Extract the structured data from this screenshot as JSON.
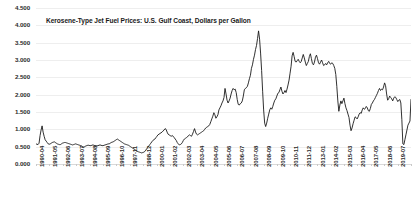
{
  "chart_data": {
    "type": "line",
    "title": "Kerosene-Type Jet Fuel Prices: U.S. Gulf Coast, Dollars per Gallon",
    "xlabel": "",
    "ylabel": "",
    "ylim": [
      0.0,
      4.5
    ],
    "grid": true,
    "legend": false,
    "line_color": "#1a1a1a",
    "ytick_labels": [
      "4.500",
      "4.000",
      "3.500",
      "3.000",
      "2.500",
      "2.000",
      "1.500",
      "1.000",
      "0.500",
      "0.000"
    ],
    "ytick_values": [
      4.5,
      4.0,
      3.5,
      3.0,
      2.5,
      2.0,
      1.5,
      1.0,
      0.5,
      0.0
    ],
    "xtick_labels": [
      "1990-04",
      "1991-05",
      "1992-06",
      "1993-07",
      "1994-08",
      "1995-09",
      "1996-10",
      "1997-11",
      "1998-12",
      "2000-01",
      "2001-02",
      "2002-03",
      "2003-04",
      "2004-05",
      "2005-06",
      "2006-07",
      "2007-08",
      "2008-09",
      "2009-10",
      "2010-11",
      "2011-12",
      "2013-01",
      "2014-02",
      "2015-03",
      "2016-04",
      "2017-05",
      "2018-06",
      "2019-07",
      "2020-08"
    ],
    "x_start": "1990-04",
    "x_end": "2020-08",
    "x_interval_months": 1,
    "values": [
      0.58,
      0.57,
      0.56,
      0.6,
      0.82,
      0.98,
      1.1,
      0.92,
      0.8,
      0.7,
      0.66,
      0.62,
      0.58,
      0.57,
      0.58,
      0.6,
      0.62,
      0.63,
      0.64,
      0.62,
      0.6,
      0.58,
      0.57,
      0.56,
      0.56,
      0.58,
      0.6,
      0.61,
      0.62,
      0.62,
      0.61,
      0.6,
      0.59,
      0.58,
      0.57,
      0.56,
      0.55,
      0.56,
      0.57,
      0.58,
      0.57,
      0.56,
      0.55,
      0.54,
      0.53,
      0.52,
      0.5,
      0.49,
      0.5,
      0.52,
      0.53,
      0.54,
      0.54,
      0.53,
      0.53,
      0.54,
      0.55,
      0.54,
      0.53,
      0.53,
      0.52,
      0.53,
      0.54,
      0.55,
      0.54,
      0.53,
      0.53,
      0.54,
      0.55,
      0.56,
      0.57,
      0.58,
      0.58,
      0.6,
      0.62,
      0.63,
      0.64,
      0.66,
      0.68,
      0.7,
      0.72,
      0.7,
      0.68,
      0.66,
      0.64,
      0.62,
      0.6,
      0.58,
      0.57,
      0.56,
      0.55,
      0.54,
      0.52,
      0.5,
      0.48,
      0.46,
      0.44,
      0.42,
      0.4,
      0.38,
      0.36,
      0.35,
      0.34,
      0.33,
      0.32,
      0.33,
      0.34,
      0.36,
      0.4,
      0.44,
      0.48,
      0.52,
      0.56,
      0.6,
      0.64,
      0.68,
      0.7,
      0.72,
      0.76,
      0.8,
      0.84,
      0.86,
      0.88,
      0.9,
      0.92,
      0.95,
      0.98,
      1.02,
      1.0,
      0.92,
      0.86,
      0.84,
      0.82,
      0.8,
      0.82,
      0.8,
      0.76,
      0.72,
      0.68,
      0.62,
      0.58,
      0.55,
      0.56,
      0.58,
      0.62,
      0.68,
      0.72,
      0.74,
      0.76,
      0.78,
      0.82,
      0.84,
      0.82,
      0.8,
      0.86,
      0.94,
      1.02,
      0.92,
      0.86,
      0.84,
      0.86,
      0.88,
      0.9,
      0.92,
      0.94,
      0.96,
      1.0,
      1.04,
      1.06,
      1.08,
      1.1,
      1.14,
      1.22,
      1.3,
      1.38,
      1.48,
      1.42,
      1.32,
      1.36,
      1.42,
      1.56,
      1.62,
      1.68,
      1.76,
      1.82,
      1.92,
      2.18,
      2.02,
      1.84,
      1.76,
      1.82,
      1.9,
      2.02,
      2.12,
      2.18,
      2.14,
      2.16,
      2.06,
      1.86,
      1.72,
      1.7,
      1.74,
      1.76,
      1.82,
      1.96,
      2.14,
      2.18,
      2.2,
      2.24,
      2.34,
      2.46,
      2.56,
      2.76,
      2.86,
      3.02,
      3.14,
      3.3,
      3.42,
      3.62,
      3.84,
      3.6,
      3.2,
      2.7,
      2.1,
      1.56,
      1.18,
      1.08,
      1.18,
      1.32,
      1.44,
      1.56,
      1.62,
      1.58,
      1.66,
      1.76,
      1.84,
      1.88,
      1.96,
      2.04,
      2.06,
      2.14,
      2.22,
      2.1,
      2.02,
      2.06,
      2.12,
      2.06,
      2.16,
      2.28,
      2.42,
      2.62,
      2.82,
      3.12,
      3.22,
      3.1,
      2.96,
      2.94,
      2.98,
      3.02,
      2.96,
      2.92,
      2.96,
      3.06,
      3.16,
      3.06,
      2.94,
      2.84,
      2.9,
      2.96,
      3.1,
      3.18,
      3.04,
      2.9,
      2.86,
      2.94,
      3.08,
      3.14,
      3.04,
      2.92,
      2.88,
      2.94,
      3.0,
      2.92,
      2.84,
      2.86,
      2.9,
      2.86,
      2.92,
      2.96,
      2.9,
      2.88,
      2.92,
      2.9,
      2.84,
      2.76,
      2.58,
      2.24,
      1.82,
      1.52,
      1.7,
      1.82,
      1.74,
      1.82,
      1.9,
      1.74,
      1.62,
      1.54,
      1.44,
      1.34,
      1.12,
      0.96,
      1.04,
      1.16,
      1.26,
      1.36,
      1.34,
      1.3,
      1.36,
      1.44,
      1.48,
      1.46,
      1.56,
      1.62,
      1.58,
      1.6,
      1.66,
      1.62,
      1.54,
      1.52,
      1.6,
      1.72,
      1.76,
      1.82,
      1.86,
      1.92,
      1.98,
      2.04,
      2.12,
      2.18,
      2.12,
      2.16,
      2.14,
      2.22,
      2.34,
      2.26,
      2.02,
      1.84,
      1.88,
      1.96,
      1.92,
      1.88,
      1.82,
      1.9,
      1.94,
      1.92,
      1.86,
      1.8,
      1.84,
      1.86,
      1.76,
      1.28,
      0.58,
      0.56,
      0.7,
      0.84,
      0.98,
      1.12,
      1.18,
      1.24,
      1.86
    ]
  }
}
